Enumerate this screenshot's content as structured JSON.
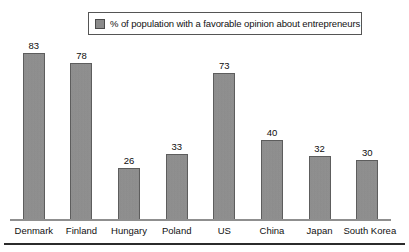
{
  "legend": {
    "swatch_color": "#8e8e8e",
    "label": "% of population with a favorable opinion about entrepreneurs"
  },
  "axis": {
    "baseline_visible": true
  },
  "chart_data": {
    "type": "bar",
    "title": "",
    "subtitle": "",
    "xlabel": "",
    "ylabel": "",
    "ylim": [
      0,
      90
    ],
    "grid": false,
    "legend_position": "top",
    "legend_entries": [
      "% of population with a favorable opinion about entrepreneurs"
    ],
    "bar_color": "#8e8e8e",
    "data_labels": true,
    "axis_tick_labels": [],
    "categories": [
      "Denmark",
      "Finland",
      "Hungary",
      "Poland",
      "US",
      "China",
      "Japan",
      "South Korea"
    ],
    "values": [
      83,
      78,
      26,
      33,
      73,
      40,
      32,
      30
    ],
    "series": [
      {
        "name": "% of population with a favorable opinion about entrepreneurs",
        "values": [
          83,
          78,
          26,
          33,
          73,
          40,
          32,
          30
        ]
      }
    ],
    "points": [
      {
        "category": "Denmark",
        "value": 83
      },
      {
        "category": "Finland",
        "value": 78
      },
      {
        "category": "Hungary",
        "value": 26
      },
      {
        "category": "Poland",
        "value": 33
      },
      {
        "category": "US",
        "value": 73
      },
      {
        "category": "China",
        "value": 40
      },
      {
        "category": "Japan",
        "value": 32
      },
      {
        "category": "South Korea",
        "value": 30
      }
    ]
  }
}
